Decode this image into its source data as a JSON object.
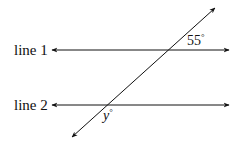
{
  "diagram": {
    "type": "parallel-lines-transversal",
    "labels": {
      "line1": "line 1",
      "line2": "line 2"
    },
    "angles": {
      "known": {
        "value": "55",
        "unit": "°"
      },
      "unknown": {
        "variable": "y",
        "unit": "°"
      }
    },
    "geometry": {
      "line1": {
        "y": 50,
        "x1": 52,
        "x2": 229
      },
      "line2": {
        "y": 105,
        "x1": 52,
        "x2": 229
      },
      "transversal": {
        "x1": 72,
        "y1": 137,
        "x2": 215,
        "y2": 8
      }
    },
    "colors": {
      "stroke": "#111111",
      "background": "#ffffff"
    }
  }
}
